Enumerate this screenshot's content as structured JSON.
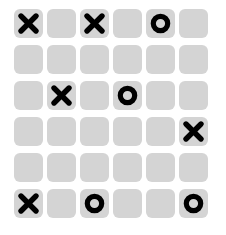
{
  "board": {
    "title": "Tic Tac Toe Board",
    "rows": 6,
    "columns": 6,
    "background_color": "#ffffff",
    "tile_color": "#d4d4d4",
    "mark_color": "#000000",
    "symbols": {
      "x": "X",
      "o": "O",
      "empty": ""
    },
    "cells": [
      [
        {
          "value": "X",
          "name": "cell-r1c1"
        },
        {
          "value": "",
          "name": "cell-r1c2"
        },
        {
          "value": "X",
          "name": "cell-r1c3"
        },
        {
          "value": "",
          "name": "cell-r1c4"
        },
        {
          "value": "O",
          "name": "cell-r1c5"
        },
        {
          "value": "",
          "name": "cell-r1c6"
        }
      ],
      [
        {
          "value": "",
          "name": "cell-r2c1"
        },
        {
          "value": "",
          "name": "cell-r2c2"
        },
        {
          "value": "",
          "name": "cell-r2c3"
        },
        {
          "value": "",
          "name": "cell-r2c4"
        },
        {
          "value": "",
          "name": "cell-r2c5"
        },
        {
          "value": "",
          "name": "cell-r2c6"
        }
      ],
      [
        {
          "value": "",
          "name": "cell-r3c1"
        },
        {
          "value": "X",
          "name": "cell-r3c2"
        },
        {
          "value": "",
          "name": "cell-r3c3"
        },
        {
          "value": "O",
          "name": "cell-r3c4"
        },
        {
          "value": "",
          "name": "cell-r3c5"
        },
        {
          "value": "",
          "name": "cell-r3c6"
        }
      ],
      [
        {
          "value": "",
          "name": "cell-r4c1"
        },
        {
          "value": "",
          "name": "cell-r4c2"
        },
        {
          "value": "",
          "name": "cell-r4c3"
        },
        {
          "value": "",
          "name": "cell-r4c4"
        },
        {
          "value": "",
          "name": "cell-r4c5"
        },
        {
          "value": "X",
          "name": "cell-r4c6"
        }
      ],
      [
        {
          "value": "",
          "name": "cell-r5c1"
        },
        {
          "value": "",
          "name": "cell-r5c2"
        },
        {
          "value": "",
          "name": "cell-r5c3"
        },
        {
          "value": "",
          "name": "cell-r5c4"
        },
        {
          "value": "",
          "name": "cell-r5c5"
        },
        {
          "value": "",
          "name": "cell-r5c6"
        }
      ],
      [
        {
          "value": "X",
          "name": "cell-r6c1"
        },
        {
          "value": "",
          "name": "cell-r6c2"
        },
        {
          "value": "O",
          "name": "cell-r6c3"
        },
        {
          "value": "",
          "name": "cell-r6c4"
        },
        {
          "value": "",
          "name": "cell-r6c5"
        },
        {
          "value": "O",
          "name": "cell-r6c6"
        }
      ]
    ]
  }
}
